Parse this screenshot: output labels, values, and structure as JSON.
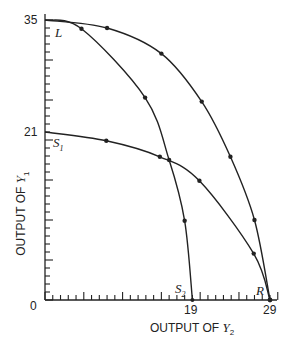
{
  "chart_data": {
    "type": "line",
    "title": "",
    "xlabel": "OUTPUT OF Y2",
    "ylabel": "OUTPUT OF Y1",
    "xlim": [
      0,
      29
    ],
    "ylim": [
      0,
      35
    ],
    "grid": false,
    "legend": "none",
    "x_tick_labels": [
      "0",
      "19",
      "29"
    ],
    "y_tick_labels": [
      "0",
      "21",
      "35"
    ],
    "point_labels": [
      "L",
      "S1",
      "S2",
      "R"
    ],
    "series": [
      {
        "name": "L-R (outer frontier)",
        "points": [
          [
            0,
            35
          ],
          [
            8,
            34
          ],
          [
            15,
            30.8
          ],
          [
            20.2,
            24.8
          ],
          [
            23.9,
            17.9
          ],
          [
            27,
            10
          ],
          [
            29,
            0
          ]
        ]
      },
      {
        "name": "L-S2 (inner frontier)",
        "points": [
          [
            0,
            35
          ],
          [
            4.7,
            33.9
          ],
          [
            12.9,
            25.3
          ],
          [
            16,
            17.5
          ],
          [
            18,
            9.9
          ],
          [
            19,
            0
          ]
        ]
      },
      {
        "name": "S1-R",
        "points": [
          [
            0,
            21
          ],
          [
            7.9,
            19.9
          ],
          [
            14.8,
            17.9
          ],
          [
            19.9,
            14.9
          ],
          [
            26.9,
            5.8
          ],
          [
            29,
            0
          ]
        ]
      }
    ]
  },
  "labels": {
    "y_top": "35",
    "y_mid": "21",
    "origin": "0",
    "x_mid": "19",
    "x_end": "29",
    "L": "L",
    "S1_main": "S",
    "S1_sub": "1",
    "S2_main": "S",
    "S2_sub": "2",
    "R": "R",
    "xaxis_main": "OUTPUT OF ",
    "xaxis_var": "Y",
    "xaxis_sub": "2",
    "yaxis_main": "OUTPUT OF ",
    "yaxis_var": "Y",
    "yaxis_sub": "1"
  }
}
